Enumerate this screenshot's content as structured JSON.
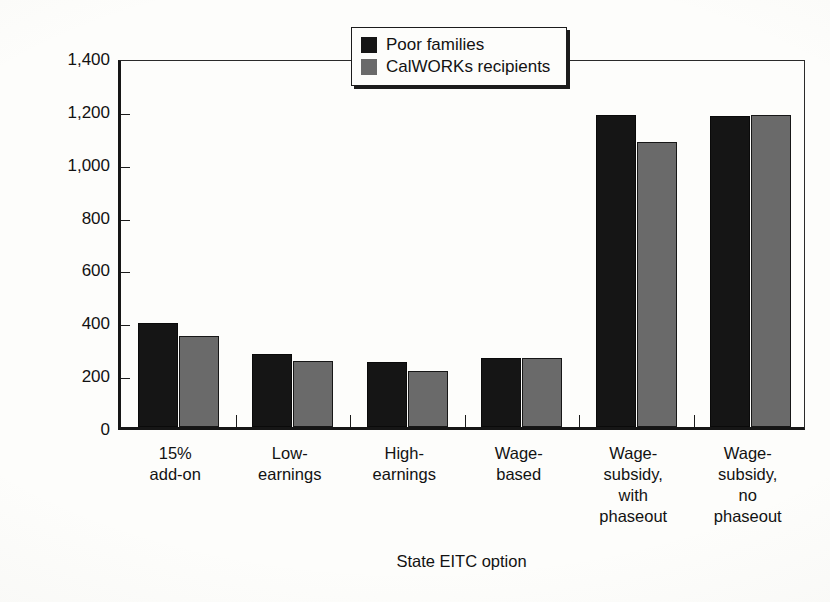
{
  "chart_data": {
    "type": "bar",
    "title": "",
    "subtitle": "",
    "xlabel": "State EITC option",
    "ylabel": "Average annual benefit ($)",
    "categories": [
      "15%\nadd-on",
      "Low-\nearnings",
      "High-\nearnings",
      "Wage-\nbased",
      "Wage-\nsubsidy,\nwith\nphaseout",
      "Wage-\nsubsidy,\nno\nphaseout"
    ],
    "series": [
      {
        "name": "Poor families",
        "color": "#151515",
        "values": [
          395,
          275,
          245,
          260,
          1180,
          1175
        ]
      },
      {
        "name": "CalWORKs recipients",
        "color": "#6a6a6a",
        "values": [
          345,
          250,
          212,
          262,
          1080,
          1180
        ]
      }
    ],
    "ylim": [
      0,
      1400
    ],
    "yticks": [
      0,
      200,
      400,
      600,
      800,
      1000,
      1200,
      1400
    ],
    "ytick_labels": [
      "0",
      "200",
      "400",
      "600",
      "800",
      "1,000",
      "1,200",
      "1,400"
    ],
    "grid": false,
    "legend_position": "top-center",
    "bar_orientation": "vertical",
    "group_mode": "clustered"
  },
  "legend": {
    "entries": [
      {
        "label": "Poor families",
        "swatch": "black-square-swatch"
      },
      {
        "label": "CalWORKs recipients",
        "swatch": "gray-square-swatch"
      }
    ]
  }
}
